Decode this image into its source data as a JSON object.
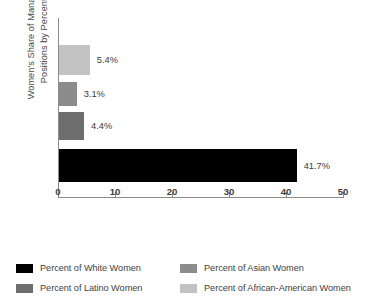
{
  "chart_data": {
    "type": "bar",
    "orientation": "horizontal",
    "title": "",
    "xlabel": "",
    "ylabel": "Women's Share of Management Positions by Percentage",
    "ylabel_lines": [
      "Women's Share of Management",
      "Positions by Percentage"
    ],
    "xlim": [
      0,
      50
    ],
    "xticks": [
      0,
      10,
      20,
      30,
      40,
      50
    ],
    "xtick_labels": [
      "0",
      "10",
      "20",
      "30",
      "40",
      "50"
    ],
    "grid": false,
    "legend_position": "bottom",
    "categories": [
      "Percent of White Women",
      "Percent of Latino Women",
      "Percent of Asian Women",
      "Percent of African-American Women"
    ],
    "values": [
      41.7,
      4.4,
      3.1,
      5.4
    ],
    "value_labels": [
      "41.7%",
      "4.4%",
      "3.1%",
      "5.4%"
    ],
    "colors": [
      "#000000",
      "#6e6e6e",
      "#8c8c8c",
      "#c2c2c2"
    ],
    "bars": [
      {
        "label": "Percent of African-American Women",
        "value": 5.4,
        "value_label": "5.4%",
        "color": "#c2c2c2"
      },
      {
        "label": "Percent of Asian Women",
        "value": 3.1,
        "value_label": "3.1%",
        "color": "#8c8c8c"
      },
      {
        "label": "Percent of Latino Women",
        "value": 4.4,
        "value_label": "4.4%",
        "color": "#6e6e6e"
      },
      {
        "label": "Percent of White Women",
        "value": 41.7,
        "value_label": "41.7%",
        "color": "#000000"
      }
    ]
  },
  "axis": {
    "y_title_line1": "Women's Share of Management",
    "y_title_line2": "Positions by Percentage",
    "x_ticks": [
      {
        "value": 0,
        "label": "0"
      },
      {
        "value": 10,
        "label": "10"
      },
      {
        "value": 20,
        "label": "20"
      },
      {
        "value": 30,
        "label": "30"
      },
      {
        "value": 40,
        "label": "40"
      },
      {
        "value": 50,
        "label": "50"
      }
    ],
    "axis_color": "#8c8c8c"
  },
  "legend": {
    "items": [
      {
        "label": "Percent of White Women",
        "color": "#000000"
      },
      {
        "label": "Percent of Asian Women",
        "color": "#8c8c8c"
      },
      {
        "label": "Percent of Latino Women",
        "color": "#6e6e6e"
      },
      {
        "label": "Percent of African-American Women",
        "color": "#c2c2c2"
      }
    ]
  }
}
